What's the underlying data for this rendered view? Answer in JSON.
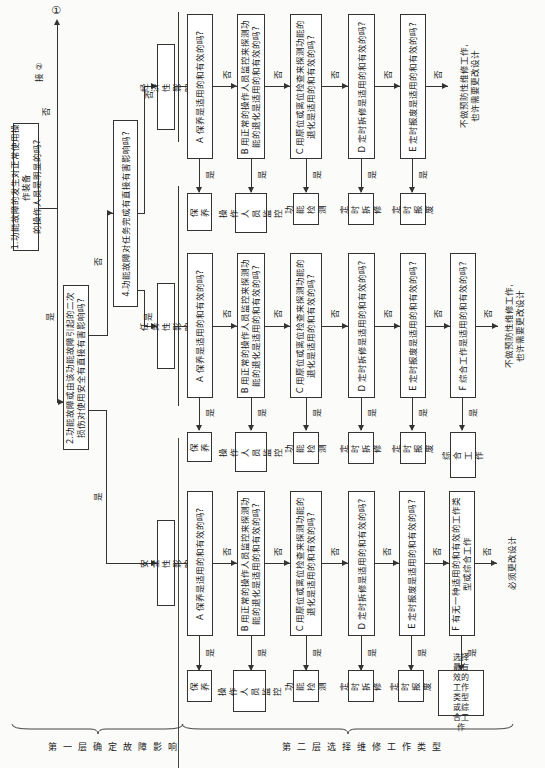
{
  "questions": {
    "q1": "1.功能故障的发生对正常使用操作装备\n的操作人员是明显的吗?",
    "q2": "2.功能故障或由该功能故障引起的二次\n损伤对使用安全有直接有害影响吗?",
    "q4": "4.功能故障对任务完成有直接有害影响吗?"
  },
  "connectors": {
    "yes": "是",
    "no": "否",
    "goto2": "接 ②",
    "circle1": "①"
  },
  "categories": {
    "economic": "经济性影响",
    "mission": "任务性影响",
    "safety": "安全性影响"
  },
  "rows": {
    "economic": {
      "questions": [
        "A 保养是适用的和有效的吗?",
        "B 用正常的操作人员监控来探测功\n能的退化是适用的和有效的吗?",
        "C 用原位或离位检查来探测功能的\n退化是适用的和有效的吗?",
        "D 定时拆修是适用的和有效的吗?",
        "E 定时报废是适用的和有效的吗?"
      ],
      "tasks": [
        "保养",
        "操作人\n员监控",
        "功能\n检测",
        "定时\n拆修",
        "定时\n报废"
      ],
      "outcome": "不做预防性维修工作,\n也许需要更改设计"
    },
    "mission": {
      "questions": [
        "A 保养是适用的和有效的吗?",
        "B 用正常的操作人员监控来探测功\n能的退化是适用的和有效的吗?",
        "C 用原位或离位检查来探测功能的\n退化是适用的和有效的吗?",
        "D 定时拆修是适用的和有效的吗?",
        "E 定时报废是适用的和有效的吗?",
        "F 综合工作是适用的和有效的吗?"
      ],
      "tasks": [
        "保养",
        "操作人\n员监控",
        "功能\n检测",
        "定时\n拆修",
        "定时\n报废",
        "综合工作"
      ],
      "outcome": "不做预防性维修工作,\n也许需要更改设计"
    },
    "safety": {
      "questions": [
        "A 保养是适用的和有效的吗?",
        "B 用正常的操作人员监控来探测功\n能的退化是适用的和有效的吗?",
        "C 用原位或离位检查来探测功能的\n退化是适用的和有效的吗?",
        "D 定时拆修是适用的和有效的吗?",
        "E 定时报废是适用的和有效的吗?",
        "F 有无一种适用的和有效的工作类\n型或综合工作"
      ],
      "tasks": [
        "保养",
        "操作人\n员监控",
        "功能\n检测",
        "定时\n拆修",
        "定时\n报废",
        "选择最有\n效的工作\n类型或综\n合工作"
      ],
      "outcome": "必须更改设计"
    }
  },
  "layers": {
    "layer1": "第一层确定故障影响",
    "layer2": "第二层选择维修工作类型"
  }
}
